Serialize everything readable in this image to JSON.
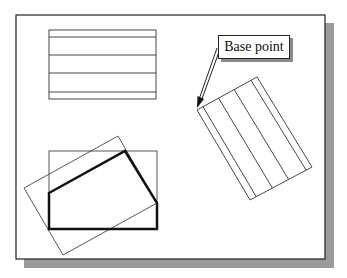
{
  "figure": {
    "type": "cad-rotate-illustration",
    "frame": {
      "x": 16,
      "y": 15,
      "width": 309,
      "height": 244,
      "stroke": "#222222",
      "shadow_color": "#9a9a9a",
      "shadow_offset": 9
    },
    "label": {
      "text": "Base point",
      "arrow_from": [
        218,
        48
      ],
      "arrow_to": [
        197,
        108
      ]
    },
    "top_rectangle": {
      "x": 49,
      "y": 30,
      "width": 107,
      "height": 69,
      "horizontal_lines_y": [
        37,
        55,
        73,
        92
      ]
    },
    "rotated_rectangle": {
      "corners": [
        [
          197,
          110
        ],
        [
          257,
          77
        ],
        [
          312,
          167
        ],
        [
          250,
          200
        ]
      ],
      "interior_fractions": [
        0.1,
        0.36,
        0.62,
        0.9
      ]
    },
    "bottom_rectangle": {
      "x": 49,
      "y": 151,
      "width": 108,
      "height": 78
    },
    "rotated_bounding_rectangle": {
      "corners": [
        [
          118,
          136
        ],
        [
          24,
          188
        ],
        [
          63,
          255
        ],
        [
          157,
          203
        ]
      ]
    },
    "thick_polygon": {
      "points": [
        [
          49,
          193
        ],
        [
          125,
          151
        ],
        [
          157,
          203
        ],
        [
          157,
          229
        ],
        [
          49,
          229
        ]
      ],
      "stroke_width": 2.5
    }
  }
}
